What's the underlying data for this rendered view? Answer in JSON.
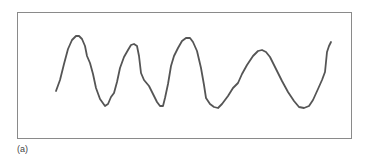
{
  "figure": {
    "label": "(a)",
    "frame_color": "#8a8a8a",
    "wave_color": "#555555",
    "wave_points": [
      [
        56,
        91
      ],
      [
        60,
        80
      ],
      [
        64,
        64
      ],
      [
        68,
        49
      ],
      [
        72,
        40
      ],
      [
        76,
        36
      ],
      [
        79,
        36
      ],
      [
        82,
        39
      ],
      [
        85,
        46
      ],
      [
        87,
        56
      ],
      [
        90,
        63
      ],
      [
        93,
        74
      ],
      [
        96,
        88
      ],
      [
        100,
        99
      ],
      [
        105,
        106
      ],
      [
        108,
        104
      ],
      [
        111,
        97
      ],
      [
        114,
        93
      ],
      [
        117,
        82
      ],
      [
        120,
        68
      ],
      [
        124,
        57
      ],
      [
        128,
        50
      ],
      [
        131,
        45
      ],
      [
        134,
        44
      ],
      [
        137,
        46
      ],
      [
        139,
        56
      ],
      [
        141,
        73
      ],
      [
        144,
        80
      ],
      [
        149,
        86
      ],
      [
        153,
        94
      ],
      [
        157,
        102
      ],
      [
        160,
        106
      ],
      [
        163,
        106
      ],
      [
        165,
        98
      ],
      [
        168,
        84
      ],
      [
        171,
        66
      ],
      [
        174,
        56
      ],
      [
        178,
        48
      ],
      [
        182,
        41
      ],
      [
        186,
        38
      ],
      [
        190,
        38
      ],
      [
        193,
        42
      ],
      [
        197,
        51
      ],
      [
        201,
        68
      ],
      [
        204,
        85
      ],
      [
        206,
        98
      ],
      [
        210,
        104
      ],
      [
        214,
        107
      ],
      [
        218,
        108
      ],
      [
        222,
        104
      ],
      [
        228,
        96
      ],
      [
        233,
        88
      ],
      [
        238,
        83
      ],
      [
        242,
        74
      ],
      [
        247,
        65
      ],
      [
        253,
        56
      ],
      [
        258,
        51
      ],
      [
        262,
        50
      ],
      [
        266,
        52
      ],
      [
        270,
        57
      ],
      [
        276,
        69
      ],
      [
        282,
        81
      ],
      [
        288,
        92
      ],
      [
        294,
        101
      ],
      [
        299,
        107
      ],
      [
        304,
        108
      ],
      [
        309,
        106
      ],
      [
        313,
        100
      ],
      [
        318,
        89
      ],
      [
        322,
        80
      ],
      [
        325,
        72
      ],
      [
        326,
        62
      ],
      [
        327,
        52
      ],
      [
        329,
        46
      ],
      [
        331,
        42
      ]
    ]
  }
}
